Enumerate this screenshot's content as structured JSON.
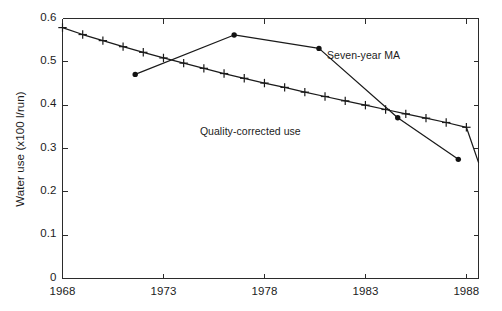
{
  "chart_data": {
    "type": "line",
    "title": "",
    "xlabel": "",
    "ylabel": "Water use (x100 l/run)",
    "xlim": [
      1968,
      1988.6
    ],
    "ylim": [
      0,
      0.6
    ],
    "grid": false,
    "legend_position": "inline-annotations",
    "xticks": [
      "1968",
      "1973",
      "1978",
      "1983",
      "1988"
    ],
    "xtick_values": [
      1968,
      1973,
      1978,
      1983,
      1988
    ],
    "yticks": [
      "0",
      "0.1",
      "0.2",
      "0.3",
      "0.4",
      "0.5",
      "0.6"
    ],
    "ytick_values": [
      0,
      0.1,
      0.2,
      0.3,
      0.4,
      0.5,
      0.6
    ],
    "series": [
      {
        "name": "Quality-corrected use",
        "marker": "plus",
        "annotation": "Quality-corrected use",
        "annotation_x": 1977.3,
        "annotation_y": 0.338,
        "x": [
          1968,
          1969,
          1970,
          1971,
          1972,
          1973,
          1974,
          1975,
          1976,
          1977,
          1978,
          1979,
          1980,
          1981,
          1982,
          1983,
          1984,
          1985,
          1986,
          1987,
          1988,
          1988.6
        ],
        "values": [
          0.579,
          0.563,
          0.549,
          0.535,
          0.522,
          0.509,
          0.497,
          0.485,
          0.473,
          0.462,
          0.451,
          0.441,
          0.43,
          0.42,
          0.41,
          0.4,
          0.39,
          0.38,
          0.37,
          0.36,
          0.349,
          0.268
        ]
      },
      {
        "name": "Seven-year MA",
        "marker": "dot",
        "annotation": "Seven-year MA",
        "annotation_x": 1981.1,
        "annotation_y": 0.513,
        "x": [
          1971.6,
          1976.5,
          1980.7,
          1984.6,
          1987.6
        ],
        "values": [
          0.471,
          0.562,
          0.531,
          0.371,
          0.275
        ]
      }
    ]
  },
  "axes": {
    "y_title": "Water use (x100 l/run)"
  }
}
